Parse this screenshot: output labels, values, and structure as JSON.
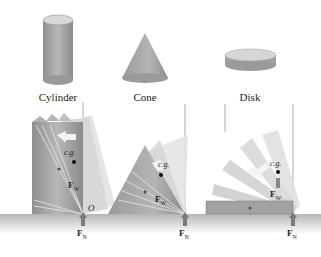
{
  "shapes": [
    {
      "name": "Cylinder",
      "label": "Cylinder"
    },
    {
      "name": "Cone",
      "label": "Cone"
    },
    {
      "name": "Disk",
      "label": "Disk"
    }
  ],
  "annotations": {
    "cg": "c.g.",
    "weight": "F",
    "weight_sub": "W",
    "normal": "F",
    "normal_sub": "N",
    "pivot": "O"
  },
  "colors": {
    "solid": "#a9a9a9",
    "solid_light": "#d0d0d0",
    "ghost": "#dcdcdc",
    "ground": "#c4c4c4",
    "arrow": "#7a7a7a"
  }
}
